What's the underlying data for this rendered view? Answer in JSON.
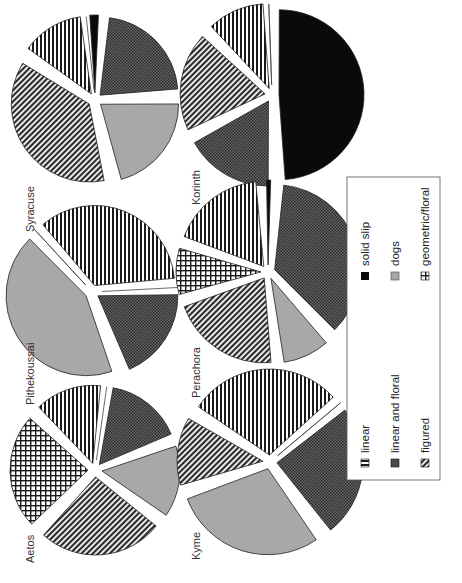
{
  "chart_data": [
    {
      "type": "pie",
      "title": "Syracuse",
      "categories": [
        "linear",
        "solid slip",
        "linear and floral",
        "dogs",
        "figured",
        "geometric/floral"
      ],
      "values": [
        14,
        3,
        23,
        22,
        38,
        0
      ]
    },
    {
      "type": "pie",
      "title": "Pithekoussai",
      "categories": [
        "linear",
        "solid slip",
        "linear and floral",
        "dogs",
        "figured",
        "geometric/floral"
      ],
      "values": [
        36,
        0,
        20,
        44,
        0,
        0
      ]
    },
    {
      "type": "pie",
      "title": "Aetos",
      "categories": [
        "linear",
        "solid slip",
        "linear and floral",
        "dogs",
        "figured",
        "geometric/floral"
      ],
      "values": [
        15,
        0,
        17,
        16,
        27,
        25
      ]
    },
    {
      "type": "pie",
      "title": "Korinth",
      "categories": [
        "linear",
        "solid slip",
        "linear and floral",
        "dogs",
        "figured",
        "geometric/floral"
      ],
      "values": [
        12,
        50,
        18,
        0,
        20,
        0
      ]
    },
    {
      "type": "pie",
      "title": "Perachora",
      "categories": [
        "linear",
        "solid slip",
        "linear and floral",
        "dogs",
        "figured",
        "geometric/floral"
      ],
      "values": [
        19,
        2,
        37,
        10,
        22,
        10
      ]
    },
    {
      "type": "pie",
      "title": "Kyme",
      "categories": [
        "linear",
        "solid slip",
        "linear and floral",
        "dogs",
        "figured",
        "geometric/floral"
      ],
      "values": [
        30,
        0,
        26,
        30,
        14,
        0
      ]
    }
  ],
  "legend": {
    "items": [
      {
        "label": "linear",
        "pattern": "horizontal-lines"
      },
      {
        "label": "solid slip",
        "pattern": "solid-black"
      },
      {
        "label": "linear and floral",
        "pattern": "dark-crosshatch"
      },
      {
        "label": "dogs",
        "pattern": "solid-grey"
      },
      {
        "label": "figured",
        "pattern": "diagonal-lines"
      },
      {
        "label": "geometric/floral",
        "pattern": "grid"
      }
    ],
    "position": "bottom-right (rotated)"
  },
  "labels": {
    "syracuse": "Syracuse",
    "pithekoussai": "Pithekoussai",
    "aetos": "Aetos",
    "korinth": "Korinth",
    "perachora": "Perachora",
    "kyme": "Kyme"
  },
  "colors": {
    "solid_slip": "#0a0a0a",
    "dogs": "#a8a8a8",
    "linear_floral": "#4a4a4a",
    "stroke": "#222222"
  },
  "orientation": "rotated 90 degrees counter-clockwise"
}
